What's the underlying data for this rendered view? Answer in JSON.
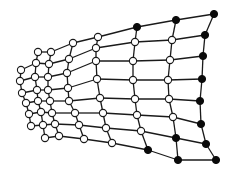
{
  "diagram": {
    "type": "warped-quad-mesh-graph",
    "width": 229,
    "height": 174,
    "colors": {
      "edge": "#1a1a1a",
      "open_node_fill": "#ffffff",
      "filled_node": "#0a0a0a"
    },
    "node_radius": 3.6,
    "nodes": [
      {
        "id": "c0r0",
        "x": 214,
        "y": 14,
        "filled": true
      },
      {
        "id": "c0r1",
        "x": 205,
        "y": 35,
        "filled": true
      },
      {
        "id": "c0r2",
        "x": 203,
        "y": 56,
        "filled": true
      },
      {
        "id": "c0r3",
        "x": 202,
        "y": 79,
        "filled": true
      },
      {
        "id": "c0r4",
        "x": 200,
        "y": 101,
        "filled": true
      },
      {
        "id": "c0r5",
        "x": 201,
        "y": 124,
        "filled": true
      },
      {
        "id": "c0r6",
        "x": 206,
        "y": 144,
        "filled": true
      },
      {
        "id": "c0r7",
        "x": 216,
        "y": 160,
        "filled": true
      },
      {
        "id": "c1r0",
        "x": 176,
        "y": 20,
        "filled": true
      },
      {
        "id": "c1r1",
        "x": 172,
        "y": 40,
        "filled": false
      },
      {
        "id": "c1r2",
        "x": 170,
        "y": 60,
        "filled": false
      },
      {
        "id": "c1r3",
        "x": 168,
        "y": 80,
        "filled": false
      },
      {
        "id": "c1r4",
        "x": 169,
        "y": 99,
        "filled": false
      },
      {
        "id": "c1r5",
        "x": 173,
        "y": 117,
        "filled": false
      },
      {
        "id": "c1r6",
        "x": 176,
        "y": 138,
        "filled": true
      },
      {
        "id": "c1r7",
        "x": 178,
        "y": 160,
        "filled": true
      },
      {
        "id": "c2r0",
        "x": 137,
        "y": 27,
        "filled": true
      },
      {
        "id": "c2r1",
        "x": 135,
        "y": 42,
        "filled": false
      },
      {
        "id": "c2r2",
        "x": 133,
        "y": 61,
        "filled": false
      },
      {
        "id": "c2r3",
        "x": 133,
        "y": 80,
        "filled": false
      },
      {
        "id": "c2r4",
        "x": 135,
        "y": 99,
        "filled": false
      },
      {
        "id": "c2r5",
        "x": 137,
        "y": 115,
        "filled": false
      },
      {
        "id": "c2r6",
        "x": 141,
        "y": 131,
        "filled": false
      },
      {
        "id": "c2r7",
        "x": 148,
        "y": 150,
        "filled": true
      },
      {
        "id": "c3r0",
        "x": 98,
        "y": 37,
        "filled": false
      },
      {
        "id": "c3r1",
        "x": 96,
        "y": 48,
        "filled": false
      },
      {
        "id": "c3r2",
        "x": 96,
        "y": 61,
        "filled": false
      },
      {
        "id": "c3r3",
        "x": 97,
        "y": 79,
        "filled": false
      },
      {
        "id": "c3r4",
        "x": 100,
        "y": 98,
        "filled": false
      },
      {
        "id": "c3r5",
        "x": 103,
        "y": 113,
        "filled": false
      },
      {
        "id": "c3r6",
        "x": 106,
        "y": 128,
        "filled": false
      },
      {
        "id": "c3r7",
        "x": 112,
        "y": 143,
        "filled": false
      },
      {
        "id": "c4r0",
        "x": 73,
        "y": 43,
        "filled": false
      },
      {
        "id": "c4r1",
        "x": 69,
        "y": 59,
        "filled": false
      },
      {
        "id": "c4r2",
        "x": 67,
        "y": 73,
        "filled": false
      },
      {
        "id": "c4r3",
        "x": 68,
        "y": 88,
        "filled": false
      },
      {
        "id": "c4r4",
        "x": 69,
        "y": 101,
        "filled": false
      },
      {
        "id": "c4r5",
        "x": 75,
        "y": 113,
        "filled": false
      },
      {
        "id": "c4r6",
        "x": 79,
        "y": 125,
        "filled": false
      },
      {
        "id": "c4r7",
        "x": 84,
        "y": 139,
        "filled": false
      },
      {
        "id": "c5r0",
        "x": 51,
        "y": 52,
        "filled": false
      },
      {
        "id": "c5r1",
        "x": 49,
        "y": 64,
        "filled": false
      },
      {
        "id": "c5r2",
        "x": 48,
        "y": 77,
        "filled": false
      },
      {
        "id": "c5r3",
        "x": 48,
        "y": 90,
        "filled": false
      },
      {
        "id": "c5r4",
        "x": 50,
        "y": 101,
        "filled": false
      },
      {
        "id": "c5r5",
        "x": 52,
        "y": 113,
        "filled": false
      },
      {
        "id": "c5r6",
        "x": 55,
        "y": 124,
        "filled": false
      },
      {
        "id": "c5r7",
        "x": 59,
        "y": 136,
        "filled": false
      },
      {
        "id": "c6r0",
        "x": 38,
        "y": 52,
        "filled": false
      },
      {
        "id": "c6r1",
        "x": 36,
        "y": 63,
        "filled": false
      },
      {
        "id": "c6r2",
        "x": 35,
        "y": 77,
        "filled": false
      },
      {
        "id": "c6r3",
        "x": 37,
        "y": 90,
        "filled": false
      },
      {
        "id": "c6r4",
        "x": 38,
        "y": 101,
        "filled": false
      },
      {
        "id": "c6r5",
        "x": 41,
        "y": 112,
        "filled": false
      },
      {
        "id": "c6r6",
        "x": 43,
        "y": 125,
        "filled": false
      },
      {
        "id": "c6r7",
        "x": 45,
        "y": 138,
        "filled": false
      },
      {
        "id": "c7r1",
        "x": 21,
        "y": 70,
        "filled": false
      },
      {
        "id": "c7r2",
        "x": 20,
        "y": 81,
        "filled": false
      },
      {
        "id": "c7r3",
        "x": 22,
        "y": 93,
        "filled": false
      },
      {
        "id": "c7r4",
        "x": 26,
        "y": 103,
        "filled": false
      },
      {
        "id": "c7r5",
        "x": 29,
        "y": 114,
        "filled": false
      },
      {
        "id": "c7r6",
        "x": 31,
        "y": 126,
        "filled": false
      }
    ],
    "edges_rule": "grid: connect each node to right/left neighbor in same row and up/down neighbor in same column"
  }
}
